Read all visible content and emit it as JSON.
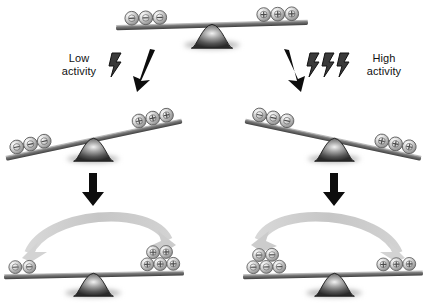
{
  "figure": {
    "type": "diagram",
    "background_color": "#ffffff",
    "ink_color": "#111111",
    "beam_color": "#6b6b6b",
    "fulcrum_color": "#4a4a4a",
    "sphere_color": "#d6d6d6",
    "curved_arrow_color": "#c9c9c9"
  },
  "labels": {
    "low_activity": "Low\nactivity",
    "high_activity": "High\nactivity"
  },
  "icons": {
    "lightning": "lightning-bolt-icon",
    "arrow_diagonal": "diagonal-arrow-icon",
    "arrow_down": "down-arrow-icon",
    "arrow_curved": "curved-arrow-icon",
    "fulcrum": "fulcrum-icon",
    "beam": "beam-icon",
    "sphere_negative": "negative-sphere-icon",
    "sphere_positive": "positive-sphere-icon"
  },
  "scales": [
    {
      "id": "top",
      "state": "balanced",
      "tilt_degrees": -2,
      "left_spheres": 3,
      "left_charge": "-",
      "right_spheres": 3,
      "right_charge": "+",
      "pivot": {
        "x": 212,
        "y": 26
      }
    },
    {
      "id": "middle-left",
      "state": "tilted-left",
      "tilt_degrees": -12,
      "left_spheres": 3,
      "left_charge": "-",
      "right_spheres": 3,
      "right_charge": "+",
      "pivot": {
        "x": 93,
        "y": 141
      }
    },
    {
      "id": "middle-right",
      "state": "tilted-right",
      "tilt_degrees": 12,
      "left_spheres": 3,
      "left_charge": "-",
      "right_spheres": 3,
      "right_charge": "+",
      "pivot": {
        "x": 334,
        "y": 141
      }
    },
    {
      "id": "bottom-left",
      "state": "level",
      "tilt_degrees": -1,
      "left_spheres": 2,
      "left_charge": "-",
      "right_spheres": 5,
      "right_charge": "+",
      "flow_direction": "left-to-right",
      "pivot": {
        "x": 93,
        "y": 275
      }
    },
    {
      "id": "bottom-right",
      "state": "level",
      "tilt_degrees": -1,
      "left_spheres": 5,
      "left_charge": "-",
      "right_spheres": 3,
      "right_charge": "+",
      "flow_direction": "right-to-left",
      "pivot": {
        "x": 334,
        "y": 275
      }
    }
  ],
  "annotations": {
    "low_bolt_count": 1,
    "high_bolt_count": 3,
    "down_arrows": 2,
    "diagonal_arrows": 2,
    "curved_arrows": 2
  }
}
